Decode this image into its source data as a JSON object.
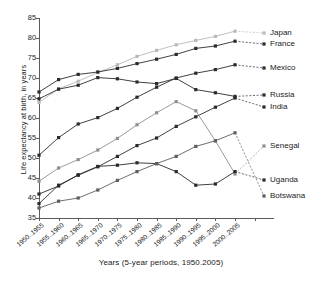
{
  "chart_data": {
    "type": "line",
    "title": "",
    "xlabel": "Years (5-year periods, 1950.2005)",
    "ylabel": "Life expectancy at birth, in years",
    "categories": [
      "1950..1955",
      "1955..1960",
      "1960..1965",
      "1965..1970",
      "1970..1975",
      "1975..1980",
      "1980..1985",
      "1985..1990",
      "1990..1995",
      "1995..2000",
      "2000..2005"
    ],
    "ylim": [
      35,
      85
    ],
    "yticks": [
      35,
      40,
      45,
      50,
      55,
      60,
      65,
      70,
      75,
      80,
      85
    ],
    "grid": false,
    "legend_position": "right",
    "series": [
      {
        "name": "Japan",
        "color": "#b9b9b9",
        "values": [
          63.9,
          67.3,
          69.2,
          71.4,
          73.3,
          75.4,
          76.9,
          78.3,
          79.4,
          80.4,
          81.7
        ]
      },
      {
        "name": "France",
        "color": "#2b2b2b",
        "values": [
          66.5,
          69.6,
          70.9,
          71.5,
          72.4,
          73.6,
          74.7,
          75.9,
          77.4,
          78.0,
          79.2
        ]
      },
      {
        "name": "Mexico",
        "color": "#2b2b2b",
        "values": [
          50.7,
          55.1,
          58.5,
          60.1,
          62.4,
          65.2,
          67.7,
          70.0,
          71.2,
          72.1,
          73.3
        ]
      },
      {
        "name": "Russia",
        "color": "#2b2b2b",
        "values": [
          64.8,
          67.2,
          68.2,
          70.1,
          69.8,
          69.0,
          68.6,
          69.9,
          67.1,
          66.3,
          65.4
        ]
      },
      {
        "name": "India",
        "color": "#2b2b2b",
        "values": [
          38.6,
          43.2,
          45.7,
          47.8,
          50.4,
          53.1,
          55.0,
          57.9,
          60.3,
          62.7,
          65.0
        ]
      },
      {
        "name": "Senegal",
        "color": "#8f8f8f",
        "values": [
          44.2,
          47.5,
          49.6,
          52.0,
          54.9,
          58.3,
          61.3,
          64.1,
          61.8,
          54.3,
          46.0
        ]
      },
      {
        "name": "Uganda",
        "color": "#2b2b2b",
        "values": [
          41.0,
          43.0,
          45.8,
          47.9,
          48.2,
          48.8,
          48.6,
          46.6,
          43.2,
          43.5,
          46.6
        ]
      },
      {
        "name": "Botswana",
        "color": "#5e5e5e",
        "values": [
          37.5,
          39.2,
          40.0,
          42.0,
          44.4,
          46.6,
          48.6,
          50.4,
          52.9,
          54.3,
          56.3
        ]
      }
    ],
    "legend_labels": [
      "Japan",
      "France",
      "Mexico",
      "Russia",
      "India",
      "Senegal",
      "Uganda",
      "Botswana"
    ]
  }
}
